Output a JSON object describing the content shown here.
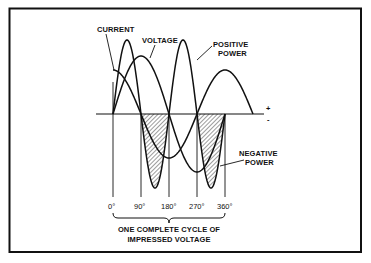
{
  "figure": {
    "labels": {
      "current": "CURRENT",
      "voltage": "VOLTAGE",
      "positive_power_line1": "POSITIVE",
      "positive_power_line2": "POWER",
      "negative_power_line1": "NEGATIVE",
      "negative_power_line2": "POWER",
      "plus": "+",
      "minus": "-"
    },
    "axis_ticks": [
      "0°",
      "90°",
      "180°",
      "270°",
      "360°"
    ],
    "caption_line1": "ONE COMPLETE CYCLE OF",
    "caption_line2": "IMPRESSED VOLTAGE"
  },
  "chart_data": {
    "type": "line",
    "title": "",
    "xlabel": "ONE COMPLETE CYCLE OF IMPRESSED VOLTAGE",
    "x_ticks": [
      "0°",
      "90°",
      "180°",
      "270°",
      "360°"
    ],
    "series": [
      {
        "name": "VOLTAGE",
        "shape": "sin(θ)",
        "relative_amplitude": 1.0
      },
      {
        "name": "CURRENT",
        "shape": "cos(θ)",
        "relative_amplitude": 0.76
      },
      {
        "name": "POWER",
        "shape": "sin(θ)·cos(θ)",
        "relative_amplitude": 1.28,
        "negative_regions_hatched": [
          "90°-180°",
          "270°-360°"
        ]
      }
    ],
    "annotations": [
      "POSITIVE POWER",
      "NEGATIVE POWER",
      "+",
      "-"
    ]
  }
}
